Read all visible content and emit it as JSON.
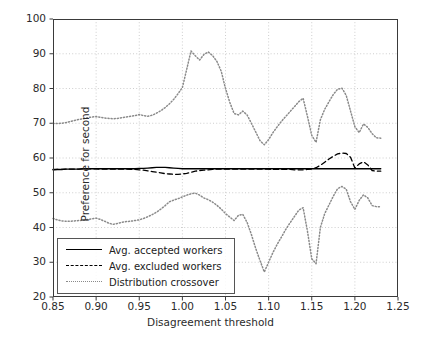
{
  "chart_data": {
    "type": "line",
    "title": "",
    "xlabel": "Disagreement threshold",
    "ylabel": "Preference for second",
    "xlim": [
      0.85,
      1.25
    ],
    "ylim": [
      20,
      100
    ],
    "xticks": [
      "0.85",
      "0.90",
      "0.95",
      "1.00",
      "1.05",
      "1.10",
      "1.15",
      "1.20",
      "1.25"
    ],
    "yticks": [
      "20",
      "30",
      "40",
      "50",
      "60",
      "70",
      "80",
      "90",
      "100"
    ],
    "grid": true,
    "grid_style": "dotted",
    "grid_color": "#c8c8c8",
    "legend_position": "lower left",
    "series": [
      {
        "name": "Avg. accepted workers",
        "style": "solid",
        "color": "#000000",
        "x": [
          0.85,
          0.855,
          0.86,
          0.865,
          0.87,
          0.875,
          0.88,
          0.885,
          0.89,
          0.895,
          0.9,
          0.905,
          0.91,
          0.915,
          0.92,
          0.925,
          0.93,
          0.935,
          0.94,
          0.945,
          0.95,
          0.955,
          0.96,
          0.965,
          0.97,
          0.975,
          0.98,
          0.985,
          0.99,
          0.995,
          1.0,
          1.005,
          1.01,
          1.015,
          1.02,
          1.025,
          1.03,
          1.035,
          1.04,
          1.045,
          1.05,
          1.055,
          1.06,
          1.065,
          1.07,
          1.075,
          1.08,
          1.085,
          1.09,
          1.095,
          1.1,
          1.105,
          1.11,
          1.115,
          1.12,
          1.125,
          1.13,
          1.135,
          1.14,
          1.145,
          1.15,
          1.155,
          1.16,
          1.165,
          1.17,
          1.175,
          1.18,
          1.185,
          1.19,
          1.195,
          1.2,
          1.205,
          1.21,
          1.215,
          1.22,
          1.225,
          1.23
        ],
        "y": [
          56.7,
          56.7,
          56.7,
          56.8,
          56.8,
          56.8,
          56.8,
          56.9,
          56.9,
          56.9,
          56.9,
          56.9,
          56.9,
          56.9,
          56.9,
          56.9,
          56.9,
          56.9,
          56.9,
          56.9,
          57.0,
          57.0,
          57.1,
          57.2,
          57.3,
          57.3,
          57.3,
          57.2,
          57.1,
          57.0,
          56.9,
          56.9,
          56.9,
          56.9,
          56.9,
          56.9,
          56.9,
          56.9,
          56.9,
          56.9,
          56.9,
          56.9,
          56.9,
          56.9,
          56.9,
          56.9,
          56.9,
          56.9,
          56.9,
          56.9,
          56.9,
          56.9,
          56.9,
          56.9,
          56.9,
          56.9,
          56.9,
          56.9,
          56.9,
          56.9,
          56.9,
          56.9,
          56.9,
          56.9,
          56.9,
          56.9,
          56.9,
          56.9,
          56.9,
          56.9,
          56.9,
          56.9,
          56.9,
          56.9,
          56.9,
          56.9,
          56.9
        ]
      },
      {
        "name": "Avg. excluded workers",
        "style": "dashed",
        "color": "#000000",
        "x": [
          0.85,
          0.855,
          0.86,
          0.865,
          0.87,
          0.875,
          0.88,
          0.885,
          0.89,
          0.895,
          0.9,
          0.905,
          0.91,
          0.915,
          0.92,
          0.925,
          0.93,
          0.935,
          0.94,
          0.945,
          0.95,
          0.955,
          0.96,
          0.965,
          0.97,
          0.975,
          0.98,
          0.985,
          0.99,
          0.995,
          1.0,
          1.005,
          1.01,
          1.015,
          1.02,
          1.025,
          1.03,
          1.035,
          1.04,
          1.045,
          1.05,
          1.055,
          1.06,
          1.065,
          1.07,
          1.075,
          1.08,
          1.085,
          1.09,
          1.095,
          1.1,
          1.105,
          1.11,
          1.115,
          1.12,
          1.125,
          1.13,
          1.135,
          1.14,
          1.145,
          1.15,
          1.155,
          1.16,
          1.165,
          1.17,
          1.175,
          1.18,
          1.185,
          1.19,
          1.195,
          1.2,
          1.205,
          1.21,
          1.215,
          1.22,
          1.225,
          1.23
        ],
        "y": [
          56.6,
          56.7,
          56.7,
          56.8,
          56.8,
          56.8,
          56.8,
          56.9,
          56.9,
          56.9,
          56.9,
          56.8,
          56.8,
          56.8,
          56.8,
          56.8,
          56.8,
          56.8,
          56.7,
          56.7,
          56.6,
          56.5,
          56.3,
          56.1,
          55.9,
          55.7,
          55.5,
          55.4,
          55.3,
          55.3,
          55.4,
          55.6,
          55.9,
          56.2,
          56.4,
          56.5,
          56.6,
          56.7,
          56.8,
          56.8,
          56.8,
          56.8,
          56.8,
          56.8,
          56.8,
          56.8,
          56.8,
          56.8,
          56.8,
          56.8,
          56.8,
          56.7,
          56.7,
          56.7,
          56.7,
          56.7,
          56.6,
          56.6,
          56.6,
          56.7,
          56.8,
          57.2,
          57.9,
          58.8,
          59.7,
          60.5,
          61.2,
          61.4,
          61.3,
          60.2,
          57.1,
          58.3,
          58.9,
          58.0,
          56.4,
          56.2,
          56.2
        ]
      },
      {
        "name": "Distribution crossover",
        "style": "dotted",
        "color": "#8a8a8a",
        "band": "upper",
        "x": [
          0.85,
          0.855,
          0.86,
          0.865,
          0.87,
          0.875,
          0.88,
          0.885,
          0.89,
          0.895,
          0.9,
          0.905,
          0.91,
          0.915,
          0.92,
          0.925,
          0.93,
          0.935,
          0.94,
          0.945,
          0.95,
          0.955,
          0.96,
          0.965,
          0.97,
          0.975,
          0.98,
          0.985,
          0.99,
          0.995,
          1.0,
          1.005,
          1.01,
          1.015,
          1.02,
          1.025,
          1.03,
          1.035,
          1.04,
          1.045,
          1.05,
          1.055,
          1.06,
          1.065,
          1.07,
          1.075,
          1.08,
          1.085,
          1.09,
          1.095,
          1.1,
          1.105,
          1.11,
          1.115,
          1.12,
          1.125,
          1.13,
          1.135,
          1.14,
          1.145,
          1.15,
          1.155,
          1.16,
          1.165,
          1.17,
          1.175,
          1.18,
          1.185,
          1.19,
          1.195,
          1.2,
          1.205,
          1.21,
          1.215,
          1.22,
          1.225,
          1.23
        ],
        "y": [
          69.9,
          69.9,
          70.0,
          70.2,
          70.5,
          70.8,
          71.1,
          71.3,
          71.6,
          71.8,
          71.9,
          71.7,
          71.5,
          71.4,
          71.3,
          71.4,
          71.6,
          71.8,
          72.0,
          72.2,
          72.5,
          72.2,
          72.0,
          72.3,
          72.9,
          73.6,
          74.5,
          75.6,
          76.9,
          78.5,
          80.3,
          85.5,
          90.8,
          89.4,
          88.2,
          89.8,
          90.5,
          89.5,
          87.8,
          85.0,
          80.0,
          76.0,
          72.8,
          72.4,
          73.5,
          72.4,
          70.0,
          67.5,
          65.0,
          63.8,
          65.3,
          67.3,
          69.0,
          70.6,
          72.0,
          73.4,
          74.8,
          76.2,
          77.2,
          72.0,
          66.5,
          64.5,
          71.0,
          74.0,
          76.2,
          78.3,
          79.8,
          80.1,
          78.0,
          73.5,
          69.0,
          67.3,
          69.8,
          68.8,
          67.0,
          65.8,
          65.7
        ]
      },
      {
        "name": "Distribution crossover",
        "style": "dotted",
        "color": "#8a8a8a",
        "band": "lower",
        "x": [
          0.85,
          0.855,
          0.86,
          0.865,
          0.87,
          0.875,
          0.88,
          0.885,
          0.89,
          0.895,
          0.9,
          0.905,
          0.91,
          0.915,
          0.92,
          0.925,
          0.93,
          0.935,
          0.94,
          0.945,
          0.95,
          0.955,
          0.96,
          0.965,
          0.97,
          0.975,
          0.98,
          0.985,
          0.99,
          0.995,
          1.0,
          1.005,
          1.01,
          1.015,
          1.02,
          1.025,
          1.03,
          1.035,
          1.04,
          1.045,
          1.05,
          1.055,
          1.06,
          1.065,
          1.07,
          1.075,
          1.08,
          1.085,
          1.09,
          1.095,
          1.1,
          1.105,
          1.11,
          1.115,
          1.12,
          1.125,
          1.13,
          1.135,
          1.14,
          1.145,
          1.15,
          1.155,
          1.16,
          1.165,
          1.17,
          1.175,
          1.18,
          1.185,
          1.19,
          1.195,
          1.2,
          1.205,
          1.21,
          1.215,
          1.22,
          1.225,
          1.23
        ],
        "y": [
          42.6,
          42.2,
          41.9,
          41.8,
          41.8,
          41.9,
          42.0,
          42.1,
          42.3,
          42.5,
          42.7,
          42.3,
          41.8,
          41.2,
          40.9,
          41.2,
          41.5,
          41.7,
          41.8,
          42.0,
          42.2,
          42.6,
          43.1,
          43.7,
          44.4,
          45.3,
          46.3,
          47.4,
          47.9,
          48.3,
          48.8,
          49.3,
          49.7,
          49.9,
          49.3,
          48.5,
          48.0,
          47.3,
          46.4,
          45.3,
          44.0,
          43.0,
          42.0,
          43.5,
          43.8,
          41.5,
          38.0,
          34.0,
          30.5,
          27.2,
          30.0,
          32.8,
          35.2,
          37.3,
          39.5,
          41.4,
          43.2,
          45.0,
          45.7,
          39.0,
          31.0,
          29.6,
          40.0,
          44.0,
          46.5,
          49.0,
          51.2,
          51.8,
          51.0,
          47.4,
          45.2,
          47.8,
          49.4,
          48.5,
          46.3,
          46.0,
          46.0
        ]
      }
    ]
  },
  "legend": {
    "items": [
      {
        "label": "Avg. accepted workers",
        "style": "solid"
      },
      {
        "label": "Avg. excluded workers",
        "style": "dashed"
      },
      {
        "label": "Distribution crossover",
        "style": "dotted"
      }
    ]
  }
}
